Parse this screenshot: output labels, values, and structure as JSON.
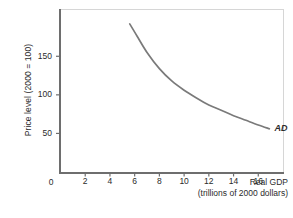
{
  "chart_data": {
    "type": "line",
    "title": "",
    "subtitle": "",
    "xlabel": "Real GDP",
    "xlabel_sub": "(trillions of 2000 dollars)",
    "ylabel": "Price level (2000 = 100)",
    "xlim": [
      0,
      18
    ],
    "ylim": [
      0,
      210
    ],
    "grid": false,
    "legend_position": "inline-annotation",
    "xticks": [
      2,
      4,
      6,
      8,
      10,
      12,
      14,
      16
    ],
    "xtick_labels": [
      "2",
      "4",
      "6",
      "8",
      "10",
      "12",
      "14",
      "16"
    ],
    "origin_label": "0",
    "yticks": [
      50,
      100,
      150
    ],
    "ytick_labels": [
      "50",
      "100",
      "150"
    ],
    "series": [
      {
        "name": "AD",
        "annotation": "AD",
        "color": "#7a7a7a",
        "x": [
          5.6,
          6.2,
          7.0,
          8.0,
          9.0,
          10.0,
          11.0,
          12.0,
          13.0,
          14.0,
          15.0,
          16.0,
          16.9
        ],
        "y": [
          192,
          176,
          155,
          134,
          118,
          106,
          96,
          87,
          80,
          73,
          67,
          61,
          56
        ]
      }
    ]
  },
  "axes": {
    "frame_color": "#d6d6d6",
    "axis_color": "#6e6e6e",
    "tick_color": "#6e6e6e",
    "text_color": "#2b2b2b",
    "background": "#ffffff"
  }
}
